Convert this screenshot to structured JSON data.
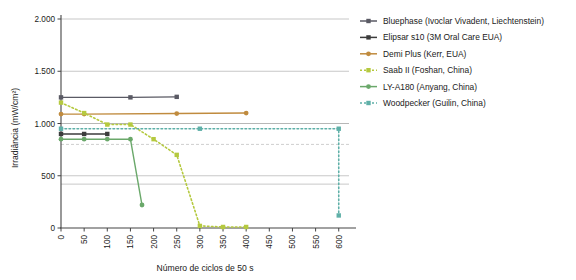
{
  "chart_data": {
    "type": "line",
    "title": "",
    "xlabel": "Número de ciclos de 50 s",
    "ylabel": "Irradiância (mW/cm²)",
    "xlim": [
      0,
      620
    ],
    "ylim": [
      0,
      2000
    ],
    "xticks": [
      0,
      50,
      100,
      150,
      200,
      250,
      300,
      350,
      400,
      450,
      500,
      550,
      600
    ],
    "xtick_labels": [
      "0",
      "50",
      "100",
      "150",
      "200",
      "250",
      "300",
      "350",
      "400",
      "450",
      "500",
      "550",
      "600"
    ],
    "yticks": [
      0,
      500,
      1000,
      1500,
      2000
    ],
    "ytick_labels": [
      "0",
      "500",
      "1.000",
      "1.500",
      "2.000"
    ],
    "grid": true,
    "grid_color": "#b0b0b0",
    "legend_position": "right",
    "reference_lines": [
      {
        "name": "upper-reference",
        "y": 1000,
        "color": "#b0b0b0",
        "style": "solid"
      },
      {
        "name": "lower-reference",
        "y": 420,
        "color": "#b0b0b0",
        "style": "solid"
      },
      {
        "name": "dashed-threshold",
        "y": 800,
        "color": "#b9b9b9",
        "style": "dashed"
      }
    ],
    "series": [
      {
        "name": "Bluephase (Ivoclar Vivadent, Liechtenstein)",
        "color": "#5a5a64",
        "style": "solid",
        "marker": "square",
        "x": [
          0,
          150,
          250
        ],
        "y": [
          1250,
          1250,
          1255
        ]
      },
      {
        "name": "Elipsar s10 (3M Oral Care EUA)",
        "color": "#3c3c3c",
        "style": "solid",
        "marker": "square",
        "x": [
          0,
          50,
          100
        ],
        "y": [
          900,
          900,
          900
        ]
      },
      {
        "name": "Demi Plus (Kerr, EUA)",
        "color": "#c08b3e",
        "style": "solid",
        "marker": "circle",
        "x": [
          0,
          50,
          250,
          400
        ],
        "y": [
          1090,
          1090,
          1095,
          1100
        ]
      },
      {
        "name": "Saab II (Foshan, China)",
        "color": "#b5c93f",
        "style": "dashed",
        "marker": "square",
        "x": [
          0,
          50,
          100,
          150,
          200,
          250,
          300,
          350,
          400
        ],
        "y": [
          1200,
          1100,
          990,
          990,
          850,
          700,
          20,
          10,
          10
        ]
      },
      {
        "name": "LY-A180 (Anyang, China)",
        "color": "#6aa86a",
        "style": "solid",
        "marker": "circle",
        "x": [
          0,
          50,
          100,
          150,
          175
        ],
        "y": [
          850,
          850,
          850,
          850,
          220
        ]
      },
      {
        "name": "Woodpecker (Guilin, China)",
        "color": "#5fb0a8",
        "style": "dashed",
        "marker": "square",
        "x": [
          0,
          300,
          600,
          600
        ],
        "y": [
          950,
          950,
          950,
          120
        ]
      }
    ]
  },
  "legend": {
    "items": [
      {
        "label": "Bluephase (Ivoclar Vivadent, Liechtenstein)"
      },
      {
        "label": "Elipsar s10 (3M Oral Care EUA)"
      },
      {
        "label": "Demi Plus (Kerr, EUA)"
      },
      {
        "label": "Saab II (Foshan, China)"
      },
      {
        "label": "LY-A180 (Anyang, China)"
      },
      {
        "label": "Woodpecker (Guilin, China)"
      }
    ]
  }
}
